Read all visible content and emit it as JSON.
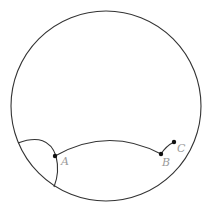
{
  "diagram": {
    "type": "poincare-disk",
    "disk": {
      "cx": 106,
      "cy": 106,
      "r": 95,
      "stroke": "#333333"
    },
    "points": [
      {
        "id": "A",
        "label": "A",
        "x": 55,
        "y": 156,
        "label_x": 61,
        "label_y": 165
      },
      {
        "id": "B",
        "label": "B",
        "x": 161,
        "y": 154,
        "label_x": 162,
        "label_y": 166
      },
      {
        "id": "C",
        "label": "C",
        "x": 174,
        "y": 142,
        "label_x": 177,
        "label_y": 152
      }
    ],
    "arcs": [
      {
        "id": "geodesic-through-A",
        "from": "boundary",
        "via": "A",
        "to": "boundary"
      },
      {
        "id": "arc-A-B",
        "from": "A",
        "to": "B"
      },
      {
        "id": "segment-B-C",
        "from": "B",
        "to": "C"
      }
    ],
    "colors": {
      "line": "#333333",
      "point": "#111111",
      "label": "#9a9a9a",
      "background": "#ffffff"
    }
  }
}
